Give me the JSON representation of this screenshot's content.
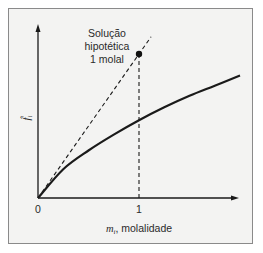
{
  "diagram": {
    "annotation": [
      "Solução",
      "hipotética",
      "1 molal"
    ],
    "y_axis_label": {
      "symbol": "f̂",
      "subscript": "i"
    },
    "x_axis_label": {
      "symbol": "m",
      "subscript": "i",
      "text": ", molalidade"
    },
    "x_ticks": [
      "0",
      "1"
    ],
    "colors": {
      "line": "#1a1a1a",
      "frame": "#8a8a8a",
      "background": "#f3f3f2"
    }
  },
  "chart_data": {
    "type": "line",
    "title": "",
    "xlabel": "m_i, molalidade",
    "ylabel": "f̂_i",
    "x_ticks": [
      0,
      1
    ],
    "xlim": [
      0,
      2
    ],
    "ylim": [
      0,
      1.2
    ],
    "series": [
      {
        "name": "real",
        "style": "solid",
        "x": [
          0,
          0.25,
          0.5,
          0.75,
          1.0,
          1.25,
          1.5,
          1.75,
          2.0
        ],
        "y": [
          0,
          0.2,
          0.33,
          0.44,
          0.54,
          0.63,
          0.71,
          0.78,
          0.85
        ]
      },
      {
        "name": "Henry's law (ideal)",
        "style": "dashed",
        "x": [
          0,
          1.12
        ],
        "y": [
          0,
          1.12
        ]
      },
      {
        "name": "vertical guide at m=1",
        "style": "dashed",
        "x": [
          1,
          1
        ],
        "y": [
          0,
          1.0
        ]
      }
    ],
    "points": [
      {
        "label": "Solução hipotética 1 molal",
        "x": 1,
        "y": 1.0
      }
    ],
    "grid": false
  }
}
